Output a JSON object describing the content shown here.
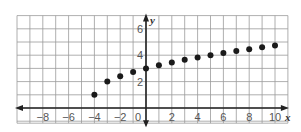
{
  "chart_data": {
    "type": "scatter",
    "title": "",
    "xlabel": "x",
    "ylabel": "y",
    "xlim": [
      -10,
      11
    ],
    "ylim": [
      -1,
      7
    ],
    "grid": true,
    "x_ticks": [
      -8,
      -6,
      -4,
      -2,
      0,
      2,
      4,
      6,
      8,
      10
    ],
    "x_tick_labels": [
      "−8",
      "−6",
      "−4",
      "−2",
      "0",
      "2",
      "4",
      "6",
      "8",
      "10"
    ],
    "y_ticks": [
      2,
      4,
      6
    ],
    "y_tick_labels": [
      "2",
      "4",
      "6"
    ],
    "series": [
      {
        "name": "points",
        "x": [
          -4,
          -3,
          -2,
          -1,
          0,
          1,
          2,
          3,
          4,
          5,
          6,
          7,
          8,
          9,
          10
        ],
        "y": [
          1,
          2,
          2.41,
          2.73,
          3,
          3.24,
          3.45,
          3.65,
          3.83,
          4,
          4.16,
          4.32,
          4.46,
          4.61,
          4.74
        ]
      }
    ],
    "colors": {
      "grid": "#9a9a9a",
      "axis": "#222222",
      "point": "#1a1a1a",
      "label": "#555555"
    }
  }
}
